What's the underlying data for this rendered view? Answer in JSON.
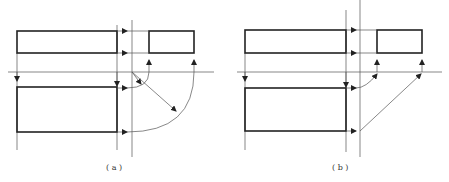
{
  "figure": {
    "panels": [
      {
        "id": "a",
        "caption": "( a )"
      },
      {
        "id": "b",
        "caption": "( b )"
      }
    ]
  },
  "colors": {
    "line": "#555555",
    "outline": "#222222",
    "background": "#ffffff"
  }
}
